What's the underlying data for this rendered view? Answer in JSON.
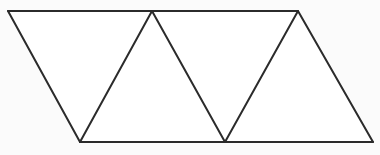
{
  "figure": {
    "name": "triangle-strip",
    "background_color": "#fbfbfb",
    "face_fill": "#ffffff",
    "stroke_color": "#2b2b2b",
    "stroke_width": 2,
    "canvas": {
      "width": 380,
      "height": 155
    },
    "vertices": {
      "top_left": {
        "x": 8,
        "y": 11
      },
      "top_mid": {
        "x": 152,
        "y": 11
      },
      "top_right": {
        "x": 298,
        "y": 11
      },
      "bottom_left": {
        "x": 80,
        "y": 142
      },
      "bottom_mid": {
        "x": 225,
        "y": 142
      },
      "bottom_right": {
        "x": 373,
        "y": 142
      }
    },
    "outline_points": "8,11 298,11 373,142 80,142",
    "edges": [
      {
        "name": "top-edge",
        "from": "top_left",
        "to": "top_right",
        "points": "8,11 298,11"
      },
      {
        "name": "bottom-edge",
        "from": "bottom_left",
        "to": "bottom_right",
        "points": "80,142 373,142"
      },
      {
        "name": "left-slant-edge",
        "from": "top_left",
        "to": "bottom_left",
        "points": "8,11 80,142"
      },
      {
        "name": "right-slant-edge",
        "from": "top_right",
        "to": "bottom_right",
        "points": "298,11 373,142"
      },
      {
        "name": "diagonal-1-up",
        "from": "bottom_left",
        "to": "top_mid",
        "points": "80,142 152,11"
      },
      {
        "name": "diagonal-2-down",
        "from": "top_mid",
        "to": "bottom_mid",
        "points": "152,11 225,142"
      },
      {
        "name": "diagonal-3-up",
        "from": "bottom_mid",
        "to": "top_right",
        "points": "225,142 298,11"
      }
    ],
    "triangles": [
      {
        "name": "triangle-1-down",
        "orientation": "down",
        "points": "8,11 152,11 80,142"
      },
      {
        "name": "triangle-2-up",
        "orientation": "up",
        "points": "80,142 152,11 225,142"
      },
      {
        "name": "triangle-3-down",
        "orientation": "down",
        "points": "152,11 298,11 225,142"
      },
      {
        "name": "triangle-4-up",
        "orientation": "up",
        "points": "225,142 298,11 373,142"
      }
    ]
  }
}
